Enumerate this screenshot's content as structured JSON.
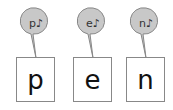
{
  "cards": [
    {
      "letter": "p",
      "bubble": "p♪"
    },
    {
      "letter": "e",
      "bubble": "e♪"
    },
    {
      "letter": "n",
      "bubble": "n♪"
    }
  ],
  "colors": {
    "bubble_fill": "#c8c8c8",
    "bubble_stroke": "#888888",
    "box_border": "#888888"
  }
}
